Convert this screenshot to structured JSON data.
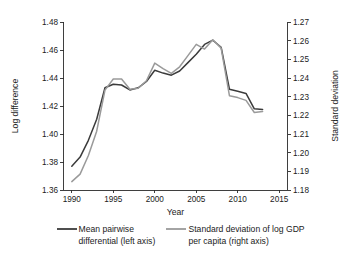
{
  "chart_data": {
    "type": "line",
    "title": "",
    "xlabel": "Year",
    "ylabel": "Log difference",
    "y2label": "Standard deviation",
    "xlim": [
      1989,
      2016
    ],
    "ylim": [
      1.36,
      1.48
    ],
    "y2lim": [
      1.18,
      1.27
    ],
    "grid": false,
    "legend_position": "bottom",
    "xticks": [
      1990,
      1995,
      2000,
      2005,
      2010,
      2015
    ],
    "xtick_labels": [
      "1990",
      "1995",
      "2000",
      "2005",
      "2010",
      "2015"
    ],
    "yticks": [
      1.36,
      1.38,
      1.4,
      1.42,
      1.44,
      1.46,
      1.48
    ],
    "ytick_labels": [
      "1.36",
      "1.38",
      "1.40",
      "1.42",
      "1.44",
      "1.46",
      "1.48"
    ],
    "y2ticks": [
      1.18,
      1.19,
      1.2,
      1.21,
      1.22,
      1.23,
      1.24,
      1.25,
      1.26,
      1.27
    ],
    "y2tick_labels": [
      "1.18",
      "1.19",
      "1.20",
      "1.21",
      "1.22",
      "1.23",
      "1.24",
      "1.25",
      "1.26",
      "1.27"
    ],
    "x": [
      1990,
      1991,
      1992,
      1993,
      1994,
      1995,
      1996,
      1997,
      1998,
      1999,
      2000,
      2001,
      2002,
      2003,
      2004,
      2005,
      2006,
      2007,
      2008,
      2009,
      2010,
      2011,
      2012,
      2013
    ],
    "series": [
      {
        "name": "Mean pairwise differential (left axis)",
        "axis": "left",
        "color": "#3b3b3b",
        "values": [
          1.377,
          1.3835,
          1.3955,
          1.4105,
          1.433,
          1.4355,
          1.435,
          1.4315,
          1.433,
          1.4375,
          1.4455,
          1.4435,
          1.442,
          1.445,
          1.451,
          1.457,
          1.464,
          1.467,
          1.462,
          1.432,
          1.4305,
          1.429,
          1.418,
          1.4175
        ]
      },
      {
        "name": "Standard deviation of log GDP per capita (right axis)",
        "axis": "right",
        "color": "#9a9a9a",
        "values": [
          1.1845,
          1.1885,
          1.1985,
          1.2115,
          1.2335,
          1.2395,
          1.2395,
          1.234,
          1.2345,
          1.2385,
          1.248,
          1.245,
          1.2425,
          1.246,
          1.252,
          1.258,
          1.2555,
          1.2605,
          1.256,
          1.2305,
          1.2295,
          1.228,
          1.2215,
          1.222
        ]
      }
    ]
  },
  "axes": {
    "x_title": "Year",
    "y_left_title": "Log difference",
    "y_right_title": "Standard deviation"
  },
  "legend": {
    "items": [
      {
        "line1": "Mean pairwise",
        "line2": "differential (left axis)",
        "color": "#3b3b3b"
      },
      {
        "line1": "Standard deviation of log GDP",
        "line2": "per capita (right axis)",
        "color": "#9a9a9a"
      }
    ]
  }
}
